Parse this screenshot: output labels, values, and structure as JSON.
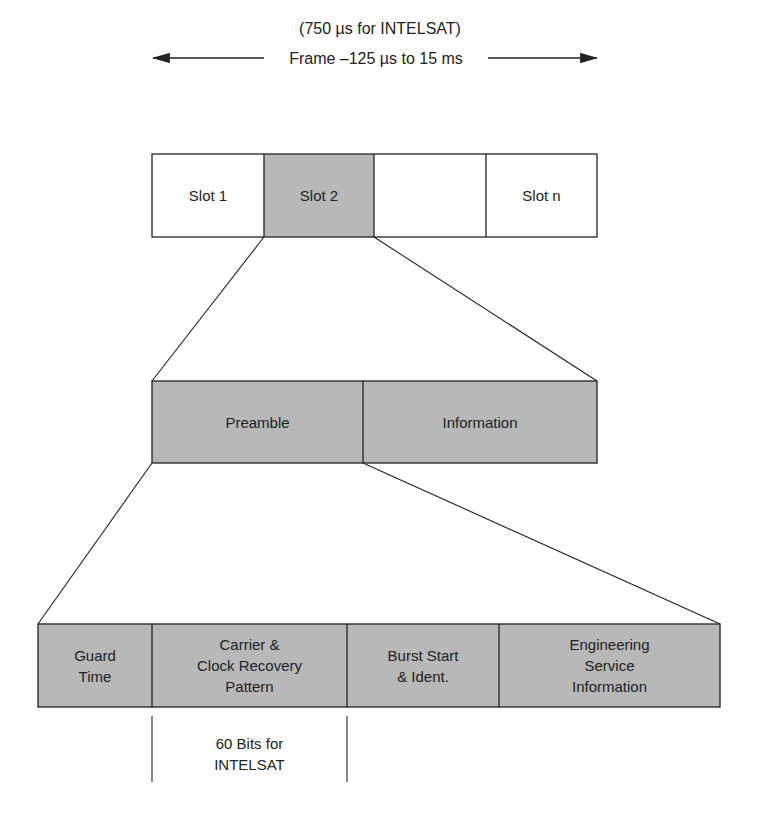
{
  "header": {
    "subtitle": "(750 µs for INTELSAT)",
    "frame_label": "Frame –125 µs to 15 ms"
  },
  "frame_row": {
    "slots": [
      {
        "label": "Slot 1",
        "shaded": false
      },
      {
        "label": "Slot 2",
        "shaded": true
      },
      {
        "label": "",
        "shaded": false
      },
      {
        "label": "Slot n",
        "shaded": false
      }
    ]
  },
  "burst_row": {
    "cells": [
      {
        "label": "Preamble"
      },
      {
        "label": "Information"
      }
    ]
  },
  "preamble_row": {
    "cells": [
      {
        "label": "Guard\nTime"
      },
      {
        "label": "Carrier &\nClock Recovery\nPattern"
      },
      {
        "label": "Burst Start\n& Ident."
      },
      {
        "label": "Engineering\nService\nInformation"
      }
    ]
  },
  "annotation": {
    "label": "60 Bits for\nINTELSAT"
  },
  "colors": {
    "shade": "#b8b8b8",
    "line": "#222222"
  }
}
